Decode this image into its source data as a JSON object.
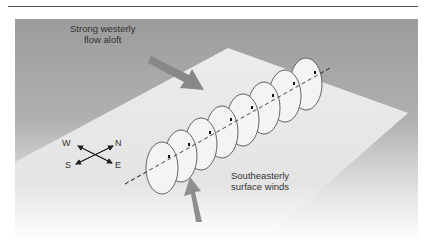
{
  "figure": {
    "labels": {
      "westerly_line1": "Strong westerly",
      "westerly_line2": "flow aloft",
      "southeasterly_line1": "Southeasterly",
      "southeasterly_line2": "surface winds"
    },
    "compass": {
      "north": "N",
      "south": "S",
      "east": "E",
      "west": "W"
    },
    "vortex_ring_count": 8,
    "colors": {
      "background_gray": "#9a9a9a",
      "plane": "#e8e8e8",
      "ring_fill": "#f4f4f4",
      "ring_stroke": "#555555",
      "arrow": "#8c8c8c",
      "text": "#333333"
    }
  }
}
